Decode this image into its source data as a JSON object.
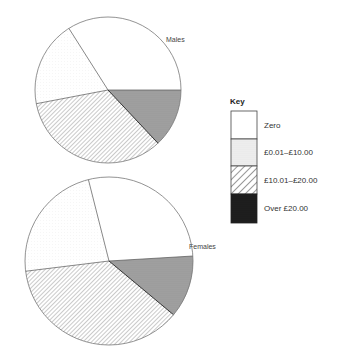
{
  "chart_data": [
    {
      "type": "pie",
      "title": "Males",
      "categories": [
        "Zero",
        "£0.01–£10.00",
        "£10.01–£20.00",
        "Over £20.00"
      ],
      "values": [
        34,
        19,
        34,
        13
      ],
      "units": "percent (estimated from slice angles)",
      "geometry": {
        "cx": 108,
        "cy": 90,
        "r": 73,
        "start_angle_deg": 0
      }
    },
    {
      "type": "pie",
      "title": "Females",
      "categories": [
        "Zero",
        "£0.01–£10.00",
        "£10.01–£20.00",
        "Over £20.00"
      ],
      "values": [
        28,
        23,
        37,
        12
      ],
      "units": "percent (estimated from slice angles)",
      "geometry": {
        "cx": 109,
        "cy": 261,
        "r": 84,
        "start_angle_deg": 3.4
      }
    }
  ],
  "legend": {
    "title": "Key",
    "items": [
      {
        "label": "Zero",
        "fill": "white"
      },
      {
        "label": "£0.01–£10.00",
        "fill": "light-dots"
      },
      {
        "label": "£10.01–£20.00",
        "fill": "hatch"
      },
      {
        "label": "Over £20.00",
        "fill": "dark"
      }
    ]
  },
  "labels": {
    "males": "Males",
    "females": "Females"
  },
  "colors": {
    "outline": "#777777",
    "spoke": "#555555",
    "dark_key": "#1a1a1a",
    "dark_pie": "#9a9a9a",
    "hatch": "#8a8a8a"
  }
}
